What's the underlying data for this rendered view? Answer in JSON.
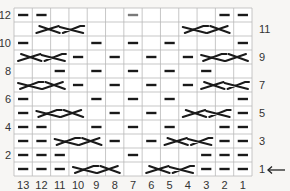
{
  "chart": {
    "columns": 13,
    "rows": 12,
    "column_labels": [
      "13",
      "12",
      "11",
      "10",
      "9",
      "8",
      "7",
      "6",
      "5",
      "4",
      "3",
      "2",
      "1"
    ],
    "left_row_labels": [
      "12",
      "10",
      "8",
      "6",
      "4",
      "2"
    ],
    "right_row_labels": [
      "11",
      "9",
      "7",
      "5",
      "3",
      "1"
    ],
    "start_indicator": "←",
    "legend_symbols": {
      "P": "purl (dash)",
      "K": "knit (blank)",
      "PG": "purl (gray dash)",
      "CL": "3-st cable crossing, leftward",
      "CR": "3-st cable crossing, rightward"
    },
    "colors": {
      "grid": "#b9b9b9",
      "ink": "#1a1a1a",
      "gray_dash": "#7a7a7a",
      "background": "#ffffff"
    },
    "rows_data": [
      {
        "row": 12,
        "cells": [
          "P",
          "P",
          "K",
          "K",
          "K",
          "K",
          "PG",
          "K",
          "K",
          "K",
          "K",
          "P",
          "P"
        ],
        "cables": []
      },
      {
        "row": 11,
        "cells": [
          "K",
          "C",
          "C",
          "C",
          "K",
          "K",
          "K",
          "K",
          "K",
          "C",
          "C",
          "C",
          "K"
        ],
        "cables": [
          {
            "from_col": 12,
            "to_col": 10,
            "type": "CL"
          },
          {
            "from_col": 4,
            "to_col": 2,
            "type": "CR"
          }
        ]
      },
      {
        "row": 10,
        "cells": [
          "P",
          "K",
          "K",
          "K",
          "P",
          "K",
          "P",
          "K",
          "P",
          "K",
          "K",
          "K",
          "P"
        ],
        "cables": []
      },
      {
        "row": 9,
        "cells": [
          "C",
          "C",
          "C",
          "P",
          "K",
          "P",
          "K",
          "P",
          "K",
          "P",
          "C",
          "C",
          "C"
        ],
        "cables": [
          {
            "from_col": 13,
            "to_col": 11,
            "type": "CL"
          },
          {
            "from_col": 3,
            "to_col": 1,
            "type": "CR"
          }
        ]
      },
      {
        "row": 8,
        "cells": [
          "K",
          "K",
          "P",
          "K",
          "P",
          "K",
          "P",
          "K",
          "P",
          "K",
          "P",
          "K",
          "K"
        ],
        "cables": []
      },
      {
        "row": 7,
        "cells": [
          "C",
          "C",
          "C",
          "P",
          "K",
          "P",
          "K",
          "P",
          "K",
          "P",
          "C",
          "C",
          "C"
        ],
        "cables": [
          {
            "from_col": 13,
            "to_col": 11,
            "type": "CR"
          },
          {
            "from_col": 3,
            "to_col": 1,
            "type": "CL"
          }
        ]
      },
      {
        "row": 6,
        "cells": [
          "P",
          "K",
          "K",
          "K",
          "P",
          "K",
          "P",
          "K",
          "P",
          "K",
          "K",
          "K",
          "P"
        ],
        "cables": []
      },
      {
        "row": 5,
        "cells": [
          "P",
          "C",
          "C",
          "C",
          "K",
          "P",
          "K",
          "P",
          "K",
          "C",
          "C",
          "C",
          "P"
        ],
        "cables": [
          {
            "from_col": 12,
            "to_col": 10,
            "type": "CR"
          },
          {
            "from_col": 4,
            "to_col": 2,
            "type": "CL"
          }
        ]
      },
      {
        "row": 4,
        "cells": [
          "P",
          "P",
          "K",
          "K",
          "P",
          "K",
          "P",
          "K",
          "P",
          "K",
          "K",
          "P",
          "P"
        ],
        "cables": []
      },
      {
        "row": 3,
        "cells": [
          "P",
          "P",
          "C",
          "C",
          "C",
          "P",
          "K",
          "P",
          "C",
          "C",
          "C",
          "P",
          "P"
        ],
        "cables": [
          {
            "from_col": 11,
            "to_col": 9,
            "type": "CR"
          },
          {
            "from_col": 5,
            "to_col": 3,
            "type": "CL"
          }
        ]
      },
      {
        "row": 2,
        "cells": [
          "P",
          "P",
          "P",
          "K",
          "K",
          "K",
          "P",
          "K",
          "K",
          "K",
          "P",
          "P",
          "P"
        ],
        "cables": []
      },
      {
        "row": 1,
        "cells": [
          "P",
          "P",
          "P",
          "C",
          "C",
          "C",
          "K",
          "C",
          "C",
          "C",
          "P",
          "P",
          "P"
        ],
        "cables": [
          {
            "from_col": 10,
            "to_col": 8,
            "type": "CR"
          },
          {
            "from_col": 6,
            "to_col": 4,
            "type": "CL"
          }
        ]
      }
    ]
  }
}
